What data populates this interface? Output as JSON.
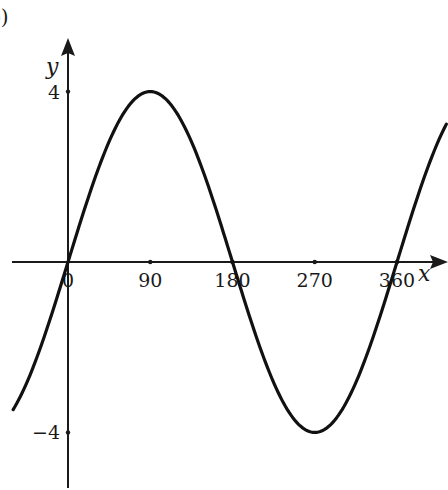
{
  "figure": {
    "part_label": "b)"
  },
  "chart_data": {
    "type": "line",
    "title": "",
    "function": "y = 4 sin x",
    "xlabel": "x",
    "ylabel": "y",
    "x_ticks": [
      0,
      90,
      180,
      270,
      360
    ],
    "x_tick_labels": [
      "0",
      "90",
      "180",
      "270",
      "360"
    ],
    "y_ticks": [
      4,
      -4
    ],
    "y_tick_labels": [
      "4",
      "−4"
    ],
    "xlim": [
      -60,
      415
    ],
    "ylim": [
      -4.9,
      5.2
    ],
    "grid": false,
    "legend": null,
    "series": [
      {
        "name": "4 sin x",
        "amplitude": 4,
        "period": 360,
        "x": [
          -60,
          -30,
          0,
          30,
          60,
          90,
          120,
          150,
          180,
          210,
          240,
          270,
          300,
          330,
          360,
          390,
          415
        ],
        "values": [
          -3.46,
          -2,
          0,
          2,
          3.46,
          4,
          3.46,
          2,
          0,
          -2,
          -3.46,
          -4,
          -3.46,
          -2,
          0,
          2,
          3.28
        ]
      }
    ],
    "colors": {
      "curve": "#111111",
      "axis": "#1a1a1a"
    }
  }
}
